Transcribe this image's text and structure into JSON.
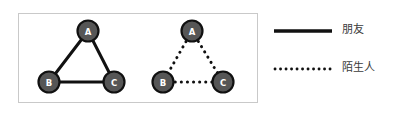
{
  "figure": {
    "title": "",
    "panel_box": {
      "x": 18,
      "y": 13,
      "width": 240,
      "height": 90,
      "border_color": "#c9c9c9"
    },
    "node_style": {
      "fill": "#565656",
      "stroke": "#111111",
      "label_color": "#ffffff",
      "radius": 11
    },
    "edge_style": {
      "solid_color": "#111111",
      "dotted_color": "#111111",
      "width": 3
    },
    "graphs": [
      {
        "id": "graph-friends",
        "relation": "朋友",
        "edge_type": "solid",
        "nodes": [
          {
            "id": "A",
            "label": "A",
            "x": 88,
            "y": 31
          },
          {
            "id": "B",
            "label": "B",
            "x": 49,
            "y": 82
          },
          {
            "id": "C",
            "label": "C",
            "x": 114,
            "y": 82
          }
        ],
        "edges": [
          {
            "from": "A",
            "to": "B"
          },
          {
            "from": "A",
            "to": "C"
          },
          {
            "from": "B",
            "to": "C"
          }
        ]
      },
      {
        "id": "graph-strangers",
        "relation": "陌生人",
        "edge_type": "dotted",
        "nodes": [
          {
            "id": "A",
            "label": "A",
            "x": 192,
            "y": 31
          },
          {
            "id": "B",
            "label": "B",
            "x": 163,
            "y": 82
          },
          {
            "id": "C",
            "label": "C",
            "x": 223,
            "y": 82
          }
        ],
        "edges": [
          {
            "from": "A",
            "to": "B"
          },
          {
            "from": "A",
            "to": "C"
          },
          {
            "from": "B",
            "to": "C"
          }
        ]
      }
    ]
  },
  "legend": {
    "items": [
      {
        "id": "friend",
        "label": "朋友",
        "line_style": "solid",
        "color": "#111111",
        "sample": {
          "x1": 274,
          "x2": 332,
          "y": 31
        }
      },
      {
        "id": "stranger",
        "label": "陌生人",
        "line_style": "dotted",
        "color": "#111111",
        "sample": {
          "x1": 274,
          "x2": 332,
          "y": 69
        }
      }
    ]
  }
}
